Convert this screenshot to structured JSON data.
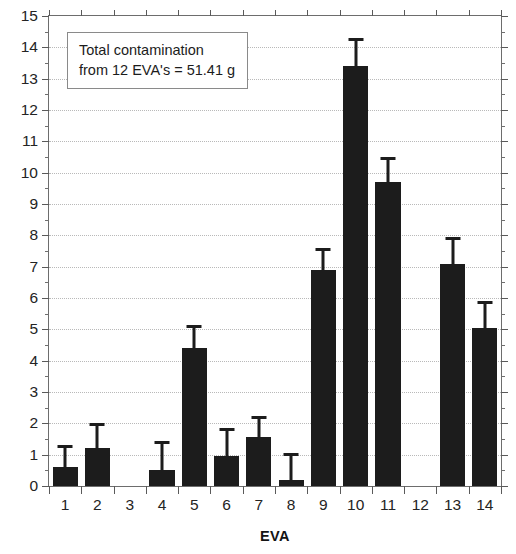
{
  "chart_data": {
    "type": "bar",
    "title": "",
    "subtitle": "",
    "xlabel": "EVA",
    "ylabel": "",
    "categories": [
      "1",
      "2",
      "3",
      "4",
      "5",
      "6",
      "7",
      "8",
      "9",
      "10",
      "11",
      "12",
      "13",
      "14"
    ],
    "values": [
      0.6,
      1.2,
      0,
      0.5,
      4.4,
      0.95,
      1.55,
      0.2,
      6.9,
      13.4,
      9.7,
      0,
      7.1,
      5.05
    ],
    "error_upper": [
      1.3,
      2.0,
      null,
      1.45,
      5.15,
      1.85,
      2.25,
      1.05,
      7.6,
      14.3,
      10.5,
      null,
      7.95,
      5.9
    ],
    "series": [
      {
        "name": "Contamination mass",
        "values": [
          0.6,
          1.2,
          0,
          0.5,
          4.4,
          0.95,
          1.55,
          0.2,
          6.9,
          13.4,
          9.7,
          0,
          7.1,
          5.05
        ]
      }
    ],
    "ylim": [
      0,
      15
    ],
    "xlim": [
      0.5,
      14.5
    ],
    "ytick_labels": [
      "0",
      "1",
      "2",
      "3",
      "4",
      "5",
      "6",
      "7",
      "8",
      "9",
      "10",
      "11",
      "12",
      "13",
      "14",
      "15"
    ],
    "ytick_values": [
      0,
      1,
      2,
      3,
      4,
      5,
      6,
      7,
      8,
      9,
      10,
      11,
      12,
      13,
      14,
      15
    ],
    "yminor_step": 0.5,
    "xtick_labels": [
      "1",
      "2",
      "3",
      "4",
      "5",
      "6",
      "7",
      "8",
      "9",
      "10",
      "11",
      "12",
      "13",
      "14"
    ],
    "grid": "horizontal-dotted",
    "legend": "none",
    "legend_position": "none",
    "bar_color": "#1c1c1c",
    "grid_color": "#b9b9b9",
    "axis_color": "#6d6d6d",
    "error_bars": "upper-only-with-caps",
    "annotations": [
      {
        "line1": "Total contamination",
        "line2": "from 12 EVA's = 51.41 g",
        "position": "top-left-inside-plot"
      }
    ]
  },
  "annotation_box": {
    "line1": "Total contamination",
    "line2": "from 12 EVA's = 51.41 g"
  },
  "axis": {
    "x_title": "EVA"
  }
}
